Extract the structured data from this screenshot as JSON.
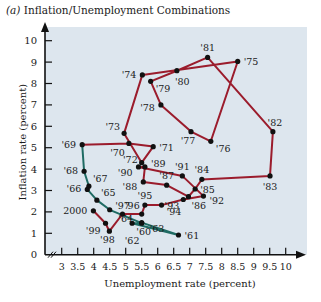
{
  "chart_data": {
    "type": "line",
    "title": "(a) Inflation/Unemployment Combinations",
    "title_prefix": "(a)",
    "title_text": "Inflation/Unemployment Combinations",
    "xlabel": "Unemployment rate (percent)",
    "ylabel": "Inflation rate (percent)",
    "xlim": [
      3,
      10
    ],
    "ylim": [
      0,
      10
    ],
    "x_ticks": [
      "3",
      "3.5",
      "4",
      "4.5",
      "5",
      "5.5",
      "6",
      "6.5",
      "7",
      "7.5",
      "8",
      "8.5",
      "9",
      "9.5",
      "10"
    ],
    "y_ticks": [
      "0",
      "1",
      "2",
      "3",
      "4",
      "5",
      "6",
      "7",
      "8",
      "9",
      "10"
    ],
    "grid": false,
    "background": "#dde6ee",
    "series": [
      {
        "name": "1960s",
        "color": "#1f6b63",
        "points": [
          {
            "label": "'60",
            "x": 5.5,
            "y": 1.5
          },
          {
            "label": "'61",
            "x": 6.65,
            "y": 0.92
          },
          {
            "label": "'62",
            "x": 5.2,
            "y": 1.47
          },
          {
            "label": "'63",
            "x": 5.5,
            "y": 1.47
          },
          {
            "label": "'64",
            "x": 4.5,
            "y": 2.1
          },
          {
            "label": "'65",
            "x": 4.1,
            "y": 2.55
          },
          {
            "label": "'66",
            "x": 3.8,
            "y": 3.05
          },
          {
            "label": "'67",
            "x": 3.85,
            "y": 3.2
          },
          {
            "label": "'68",
            "x": 3.7,
            "y": 3.9
          },
          {
            "label": "'69",
            "x": 3.64,
            "y": 5.14
          }
        ]
      },
      {
        "name": "1969-2000",
        "color": "#9b1c2c",
        "points": [
          {
            "label": "'69",
            "x": 3.64,
            "y": 5.14
          },
          {
            "label": "'70",
            "x": 5.1,
            "y": 5.2
          },
          {
            "label": "'71",
            "x": 5.86,
            "y": 5.05
          },
          {
            "label": "'72",
            "x": 5.5,
            "y": 4.3
          },
          {
            "label": "'73",
            "x": 4.95,
            "y": 5.67
          },
          {
            "label": "'74",
            "x": 5.52,
            "y": 8.4
          },
          {
            "label": "'75",
            "x": 8.5,
            "y": 9.03
          },
          {
            "label": "'76",
            "x": 7.66,
            "y": 5.3
          },
          {
            "label": "'77",
            "x": 7.04,
            "y": 5.75
          },
          {
            "label": "'78",
            "x": 6.1,
            "y": 7.0
          },
          {
            "label": "'79",
            "x": 5.78,
            "y": 8.1
          },
          {
            "label": "'80",
            "x": 6.6,
            "y": 8.6
          },
          {
            "label": "'81",
            "x": 7.56,
            "y": 9.22
          },
          {
            "label": "'82",
            "x": 9.6,
            "y": 5.75
          },
          {
            "label": "'83",
            "x": 9.51,
            "y": 3.68
          },
          {
            "label": "'84",
            "x": 7.38,
            "y": 3.52
          },
          {
            "label": "'85",
            "x": 7.17,
            "y": 3.07
          },
          {
            "label": "'86",
            "x": 6.96,
            "y": 2.71
          },
          {
            "label": "'87",
            "x": 6.28,
            "y": 3.25
          },
          {
            "label": "'88",
            "x": 5.55,
            "y": 3.4
          },
          {
            "label": "'89",
            "x": 5.6,
            "y": 4.1
          },
          {
            "label": "'90",
            "x": 5.4,
            "y": 4.1
          },
          {
            "label": "'91",
            "x": 6.77,
            "y": 3.68
          },
          {
            "label": "'92",
            "x": 7.43,
            "y": 2.74
          },
          {
            "label": "'93",
            "x": 6.8,
            "y": 2.58
          },
          {
            "label": "'94",
            "x": 6.12,
            "y": 2.32
          },
          {
            "label": "'95",
            "x": 5.6,
            "y": 2.32
          },
          {
            "label": "'96",
            "x": 5.5,
            "y": 1.9
          },
          {
            "label": "'97",
            "x": 4.9,
            "y": 1.9
          },
          {
            "label": "'98",
            "x": 4.49,
            "y": 1.1
          },
          {
            "label": "'99",
            "x": 4.37,
            "y": 1.47
          },
          {
            "label": "2000",
            "x": 3.99,
            "y": 2.05
          }
        ]
      }
    ]
  }
}
